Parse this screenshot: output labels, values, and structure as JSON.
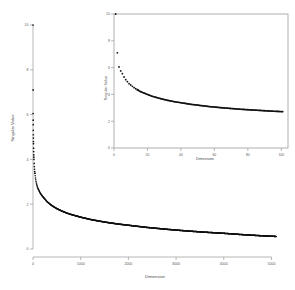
{
  "chart_data": {
    "type": "scatter",
    "title": "",
    "xlabel": "Dimension",
    "ylabel": "Singular Value",
    "xlim": [
      0,
      5200
    ],
    "ylim": [
      0,
      10
    ],
    "grid": false,
    "legend": null,
    "xticks": [
      0,
      1000,
      2000,
      3000,
      4000,
      5000
    ],
    "xticklabels": [
      "0",
      "1000",
      "2000",
      "3000",
      "4000",
      "5000"
    ],
    "yticks": [
      0,
      2,
      4,
      6,
      8,
      10
    ],
    "yticklabels": [
      "0",
      "2",
      "4",
      "6",
      "8",
      "10"
    ],
    "x": [
      1,
      2,
      3,
      4,
      5,
      6,
      7,
      8,
      9,
      10,
      12,
      14,
      16,
      18,
      20,
      24,
      28,
      32,
      36,
      40,
      50,
      60,
      70,
      80,
      90,
      100,
      150,
      200,
      300,
      400,
      500,
      600,
      700,
      800,
      900,
      1000,
      1200,
      1400,
      1600,
      1800,
      2000,
      2400,
      2800,
      3200,
      3600,
      4000,
      4400,
      4800,
      5000,
      5100
    ],
    "y": [
      10.0,
      7.1,
      6.05,
      5.75,
      5.55,
      5.3,
      5.1,
      4.95,
      4.8,
      4.7,
      4.5,
      4.35,
      4.2,
      4.1,
      4.0,
      3.82,
      3.68,
      3.56,
      3.46,
      3.38,
      3.2,
      3.06,
      2.95,
      2.86,
      2.78,
      2.72,
      2.5,
      2.35,
      2.1,
      1.93,
      1.8,
      1.7,
      1.61,
      1.54,
      1.48,
      1.42,
      1.32,
      1.24,
      1.17,
      1.11,
      1.06,
      0.96,
      0.88,
      0.81,
      0.75,
      0.7,
      0.64,
      0.59,
      0.57,
      0.56
    ],
    "inset": {
      "type": "scatter",
      "xlabel": "Dimension",
      "ylabel": "Singular Value",
      "xlim": [
        0,
        104
      ],
      "ylim": [
        0,
        10
      ],
      "xticks": [
        0,
        20,
        40,
        60,
        80,
        100
      ],
      "xticklabels": [
        "0",
        "20",
        "40",
        "60",
        "80",
        "100"
      ],
      "yticks": [
        0,
        2,
        4,
        6,
        8,
        10
      ],
      "yticklabels": [
        "0",
        "2",
        "4",
        "6",
        "8",
        "10"
      ],
      "x": [
        1,
        2,
        3,
        4,
        5,
        6,
        7,
        8,
        9,
        10,
        11,
        12,
        13,
        14,
        15,
        16,
        17,
        18,
        19,
        20,
        22,
        24,
        26,
        28,
        30,
        32,
        34,
        36,
        38,
        40,
        42,
        44,
        46,
        48,
        50,
        52,
        54,
        56,
        58,
        60,
        64,
        68,
        72,
        76,
        80,
        84,
        88,
        92,
        96,
        100
      ],
      "y": [
        10.0,
        7.1,
        6.05,
        5.75,
        5.55,
        5.3,
        5.1,
        4.95,
        4.8,
        4.7,
        4.6,
        4.5,
        4.42,
        4.35,
        4.27,
        4.2,
        4.15,
        4.1,
        4.05,
        4.0,
        3.9,
        3.82,
        3.75,
        3.68,
        3.62,
        3.56,
        3.51,
        3.46,
        3.42,
        3.38,
        3.34,
        3.3,
        3.26,
        3.23,
        3.2,
        3.17,
        3.14,
        3.11,
        3.08,
        3.06,
        3.01,
        2.97,
        2.93,
        2.89,
        2.86,
        2.83,
        2.8,
        2.77,
        2.74,
        2.72
      ]
    }
  },
  "colors": {
    "point": "#111111",
    "axis": "#9a9a9a",
    "label": "#5a5a5a",
    "background": "#ffffff"
  }
}
